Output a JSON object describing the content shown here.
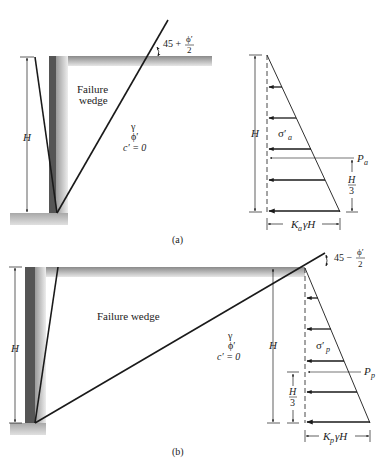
{
  "figure_a": {
    "caption": "(a)",
    "wedge_label_line1": "Failure",
    "wedge_label_line2": "wedge",
    "soil_gamma": "γ",
    "soil_phi": "ϕ′",
    "soil_cohesion": "c′ = 0",
    "height_label": "H",
    "angle_prefix": "45 +",
    "angle_num": "ϕ′",
    "angle_den": "2",
    "pressure_label": "σ′",
    "pressure_sub": "a",
    "force_label": "P",
    "force_sub": "a",
    "third_num": "H",
    "third_den": "3",
    "base_label_k": "K",
    "base_label_sub": "a",
    "base_label_rest": "γH",
    "diagram_height_label": "H"
  },
  "figure_b": {
    "caption": "(b)",
    "wedge_label": "Failure wedge",
    "soil_gamma": "γ",
    "soil_phi": "ϕ′",
    "soil_cohesion": "c′ = 0",
    "height_label": "H",
    "angle_prefix": "45 −",
    "angle_num": "ϕ′",
    "angle_den": "2",
    "pressure_label": "σ′",
    "pressure_sub": "p",
    "force_label": "P",
    "force_sub": "p",
    "third_num": "H",
    "third_den": "3",
    "base_label_k": "K",
    "base_label_sub": "p",
    "base_label_rest": "γH",
    "diagram_height_label": "H"
  },
  "colors": {
    "wall_dark": "#555555",
    "ground_gray": "#b8b8b8",
    "line": "#1a1a1a",
    "text": "#222222"
  }
}
